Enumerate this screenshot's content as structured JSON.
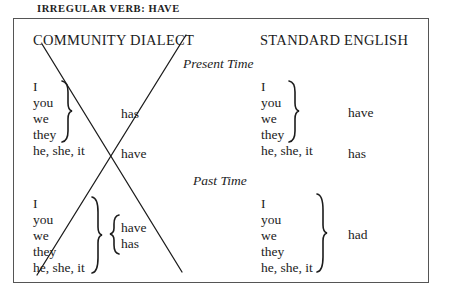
{
  "title": "IRREGULAR VERB: HAVE",
  "columns": {
    "community": "COMMUNITY DIALECT",
    "standard": "STANDARD ENGLISH"
  },
  "sections": {
    "present": {
      "label": "Present Time",
      "community": {
        "group_pronouns": [
          "I",
          "you",
          "we",
          "they"
        ],
        "group_verb": "has",
        "single_pronoun": "he, she, it",
        "single_verb": "have"
      },
      "standard": {
        "group_pronouns": [
          "I",
          "you",
          "we",
          "they"
        ],
        "group_verb": "have",
        "single_pronoun": "he, she, it",
        "single_verb": "has"
      }
    },
    "past": {
      "label": "Past Time",
      "community": {
        "pronouns": [
          "I",
          "you",
          "we",
          "they",
          "he, she, it"
        ],
        "verbs": [
          "have",
          "has"
        ]
      },
      "standard": {
        "pronouns": [
          "I",
          "you",
          "we",
          "they",
          "he, she, it"
        ],
        "verb": "had"
      }
    }
  },
  "annotation": "crossed-out community dialect column (X)"
}
